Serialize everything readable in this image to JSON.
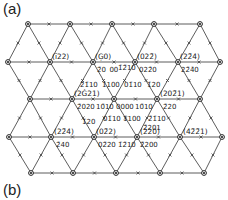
{
  "figure": {
    "panel_a_label": "(a)",
    "panel_b_label": "(b)",
    "line_color": "#333333",
    "node_color": "#222222"
  },
  "lattice": {
    "rows": [
      {
        "y": 24,
        "xs": [
          28,
          70,
          112,
          154,
          200
        ]
      },
      {
        "y": 62,
        "xs": [
          8,
          50,
          93,
          135,
          178,
          220
        ]
      },
      {
        "y": 99,
        "xs": [
          30,
          72,
          114,
          157,
          200
        ]
      },
      {
        "y": 137,
        "xs": [
          9,
          51,
          94,
          137,
          180,
          222
        ]
      },
      {
        "y": 173,
        "xs": [
          31,
          73,
          116,
          160,
          204
        ]
      }
    ]
  },
  "labels": {
    "plane_indices": [
      {
        "text": "(ī22)",
        "x": 52,
        "y": 59
      },
      {
        "text": "(Ģ0)",
        "x": 95,
        "y": 59
      },
      {
        "text": "(022̄)",
        "x": 137,
        "y": 59
      },
      {
        "text": "(22̄4)",
        "x": 180,
        "y": 59
      },
      {
        "text": "(2Ġ21)",
        "x": 74,
        "y": 96
      },
      {
        "text": "(202̄1)",
        "x": 160,
        "y": 96
      },
      {
        "text": "(22̄4)",
        "x": 54,
        "y": 134
      },
      {
        "text": "(02̄2)",
        "x": 96,
        "y": 134
      },
      {
        "text": "(220)",
        "x": 140,
        "y": 134
      },
      {
        "text": "(42̄2̄1)",
        "x": 183,
        "y": 134
      }
    ],
    "bravais_indices": [
      {
        "text": "2̄0 00",
        "x": 97,
        "y": 72
      },
      {
        "text": "1̄2̄10",
        "x": 118,
        "y": 70
      },
      {
        "text": "022̄0",
        "x": 139,
        "y": 72
      },
      {
        "text": "22̄4̄0",
        "x": 181,
        "y": 72
      },
      {
        "text": "2̄1̄10",
        "x": 80,
        "y": 87
      },
      {
        "text": "1̄100",
        "x": 102,
        "y": 87
      },
      {
        "text": "01̄10",
        "x": 124,
        "y": 87
      },
      {
        "text": "1̄20",
        "x": 147,
        "y": 87
      },
      {
        "text": "2̄020",
        "x": 77,
        "y": 109
      },
      {
        "text": "10̄10",
        "x": 96,
        "y": 109
      },
      {
        "text": "0000",
        "x": 116,
        "y": 109
      },
      {
        "text": "10̄10",
        "x": 135,
        "y": 109
      },
      {
        "text": "2̄20",
        "x": 163,
        "y": 109
      },
      {
        "text": "1̄20",
        "x": 82,
        "y": 124
      },
      {
        "text": "01̄10",
        "x": 103,
        "y": 121
      },
      {
        "text": "1̄100",
        "x": 123,
        "y": 121
      },
      {
        "text": "2̄1̄10",
        "x": 148,
        "y": 121
      },
      {
        "text": "2̄201",
        "x": 143,
        "y": 130
      },
      {
        "text": "2̄40",
        "x": 56,
        "y": 147
      },
      {
        "text": "02̄20",
        "x": 98,
        "y": 147
      },
      {
        "text": "1̄2̄10",
        "x": 118,
        "y": 147
      },
      {
        "text": "2̄200",
        "x": 140,
        "y": 147
      }
    ]
  }
}
